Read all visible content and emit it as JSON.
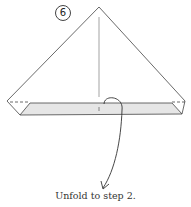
{
  "diagram": {
    "step_number": "6",
    "caption": "Unfold to step 2.",
    "colors": {
      "line": "#444444",
      "band_fill": "#e6e6e6",
      "background": "#ffffff"
    }
  }
}
